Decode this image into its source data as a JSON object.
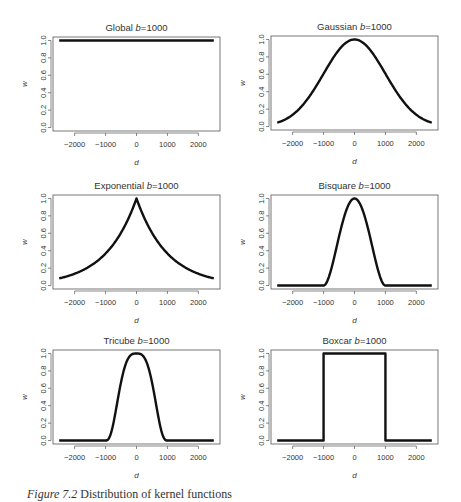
{
  "figure": {
    "caption_label": "Figure 7.2",
    "caption_text": " Distribution of kernel functions"
  },
  "style": {
    "line_color": "#111111",
    "frame_color": "#555555",
    "text_color": "#333333"
  },
  "chart_data": [
    {
      "type": "line",
      "title": "Global b=1000",
      "title_prefix": "Global ",
      "kernel": "global",
      "bandwidth": 1000,
      "xlabel": "d",
      "ylabel": "w",
      "xlim": [
        -2500,
        2500
      ],
      "ylim": [
        0,
        1
      ],
      "xticks": [
        -2000,
        -1000,
        0,
        1000,
        2000
      ],
      "yticks": [
        0.0,
        0.2,
        0.4,
        0.6,
        0.8,
        1.0
      ],
      "grid": false,
      "x": [
        -2500,
        -2000,
        -1500,
        -1000,
        -500,
        0,
        500,
        1000,
        1500,
        2000,
        2500
      ],
      "values": [
        1,
        1,
        1,
        1,
        1,
        1,
        1,
        1,
        1,
        1,
        1
      ]
    },
    {
      "type": "line",
      "title": "Gaussian b=1000",
      "title_prefix": "Gaussian ",
      "kernel": "gaussian",
      "bandwidth": 1000,
      "xlabel": "d",
      "ylabel": "w",
      "xlim": [
        -2500,
        2500
      ],
      "ylim": [
        0,
        1
      ],
      "xticks": [
        -2000,
        -1000,
        0,
        1000,
        2000
      ],
      "yticks": [
        0.0,
        0.2,
        0.4,
        0.6,
        0.8,
        1.0
      ],
      "grid": false,
      "x": [
        -2500,
        -2000,
        -1500,
        -1000,
        -500,
        0,
        500,
        1000,
        1500,
        2000,
        2500
      ],
      "values": [
        0.044,
        0.135,
        0.325,
        0.607,
        0.882,
        1.0,
        0.882,
        0.607,
        0.325,
        0.135,
        0.044
      ]
    },
    {
      "type": "line",
      "title": "Exponential b=1000",
      "title_prefix": "Exponential ",
      "kernel": "exponential",
      "bandwidth": 1000,
      "xlabel": "d",
      "ylabel": "w",
      "xlim": [
        -2500,
        2500
      ],
      "ylim": [
        0,
        1
      ],
      "xticks": [
        -2000,
        -1000,
        0,
        1000,
        2000
      ],
      "yticks": [
        0.0,
        0.2,
        0.4,
        0.6,
        0.8,
        1.0
      ],
      "grid": false,
      "x": [
        -2500,
        -2000,
        -1500,
        -1000,
        -500,
        0,
        500,
        1000,
        1500,
        2000,
        2500
      ],
      "values": [
        0.082,
        0.135,
        0.223,
        0.368,
        0.607,
        1.0,
        0.607,
        0.368,
        0.223,
        0.135,
        0.082
      ]
    },
    {
      "type": "line",
      "title": "Bisquare b=1000",
      "title_prefix": "Bisquare ",
      "kernel": "bisquare",
      "bandwidth": 1000,
      "xlabel": "d",
      "ylabel": "w",
      "xlim": [
        -2500,
        2500
      ],
      "ylim": [
        0,
        1
      ],
      "xticks": [
        -2000,
        -1000,
        0,
        1000,
        2000
      ],
      "yticks": [
        0.0,
        0.2,
        0.4,
        0.6,
        0.8,
        1.0
      ],
      "grid": false,
      "x": [
        -2500,
        -2000,
        -1500,
        -1000,
        -500,
        0,
        500,
        1000,
        1500,
        2000,
        2500
      ],
      "values": [
        0,
        0,
        0,
        0,
        0.5625,
        1.0,
        0.5625,
        0,
        0,
        0,
        0
      ]
    },
    {
      "type": "line",
      "title": "Tricube b=1000",
      "title_prefix": "Tricube ",
      "kernel": "tricube",
      "bandwidth": 1000,
      "xlabel": "d",
      "ylabel": "w",
      "xlim": [
        -2500,
        2500
      ],
      "ylim": [
        0,
        1
      ],
      "xticks": [
        -2000,
        -1000,
        0,
        1000,
        2000
      ],
      "yticks": [
        0.0,
        0.2,
        0.4,
        0.6,
        0.8,
        1.0
      ],
      "grid": false,
      "x": [
        -2500,
        -2000,
        -1500,
        -1000,
        -500,
        0,
        500,
        1000,
        1500,
        2000,
        2500
      ],
      "values": [
        0,
        0,
        0,
        0,
        0.67,
        1.0,
        0.67,
        0,
        0,
        0,
        0
      ]
    },
    {
      "type": "line",
      "title": "Boxcar b=1000",
      "title_prefix": "Boxcar ",
      "kernel": "boxcar",
      "bandwidth": 1000,
      "xlabel": "d",
      "ylabel": "w",
      "xlim": [
        -2500,
        2500
      ],
      "ylim": [
        0,
        1
      ],
      "xticks": [
        -2000,
        -1000,
        0,
        1000,
        2000
      ],
      "yticks": [
        0.0,
        0.2,
        0.4,
        0.6,
        0.8,
        1.0
      ],
      "grid": false,
      "x": [
        -2500,
        -1000,
        -1000,
        1000,
        1000,
        2500
      ],
      "values": [
        0,
        0,
        1,
        1,
        0,
        0
      ]
    }
  ]
}
